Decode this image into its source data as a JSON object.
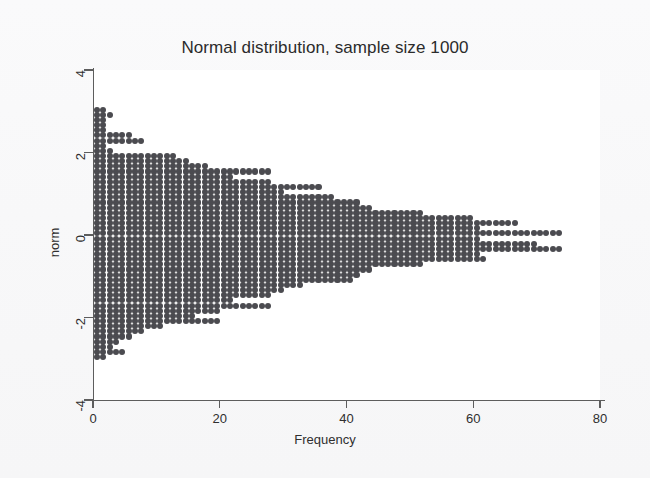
{
  "chart": {
    "title": "Normal distribution, sample size 1000",
    "x_axis": {
      "label": "Frequency",
      "ticks": [
        "0",
        "20",
        "40",
        "60",
        "80"
      ]
    },
    "y_axis": {
      "label": "norm",
      "ticks": [
        "4",
        "2",
        "0",
        "-2",
        "-4"
      ]
    },
    "colors": {
      "dot": "#4b4b50",
      "axis": "#5d5d5d",
      "plot_background": "#ffffff",
      "page_background": "#f8f8f9",
      "text": "#2b2b2b"
    }
  },
  "chart_data": {
    "type": "bar",
    "orientation": "horizontal",
    "marker": "dot-density",
    "title": "Normal distribution, sample size 1000",
    "xlabel": "Frequency",
    "ylabel": "norm",
    "xlim": [
      0,
      80
    ],
    "ylim": [
      -4,
      4
    ],
    "xticks": [
      0,
      20,
      40,
      60,
      80
    ],
    "yticks": [
      4,
      2,
      0,
      -2,
      -4
    ],
    "grid": false,
    "legend": null,
    "sample_size": 1000,
    "bin_width": 0.125,
    "note": "Each dot represents one observation; row length = bin frequency.",
    "categories": [
      3.05,
      2.925,
      2.8,
      2.675,
      2.55,
      2.425,
      2.3,
      2.175,
      2.05,
      1.925,
      1.8,
      1.675,
      1.55,
      1.425,
      1.3,
      1.175,
      1.05,
      0.925,
      0.8,
      0.675,
      0.55,
      0.425,
      0.3,
      0.175,
      0.05,
      -0.075,
      -0.2,
      -0.325,
      -0.45,
      -0.575,
      -0.7,
      -0.825,
      -0.95,
      -1.075,
      -1.2,
      -1.325,
      -1.45,
      -1.575,
      -1.7,
      -1.825,
      -1.95,
      -2.075,
      -2.2,
      -2.325,
      -2.45,
      -2.575,
      -2.7,
      -2.825,
      -2.95
    ],
    "values": [
      2,
      3,
      2,
      2,
      2,
      6,
      8,
      2,
      3,
      13,
      15,
      18,
      28,
      22,
      28,
      36,
      30,
      38,
      42,
      44,
      52,
      60,
      67,
      61,
      74,
      61,
      70,
      74,
      61,
      62,
      52,
      44,
      42,
      41,
      33,
      30,
      28,
      22,
      28,
      20,
      16,
      20,
      11,
      8,
      6,
      4,
      3,
      5,
      2
    ],
    "max_frequency": 74,
    "peak_value_y": 0.05
  }
}
